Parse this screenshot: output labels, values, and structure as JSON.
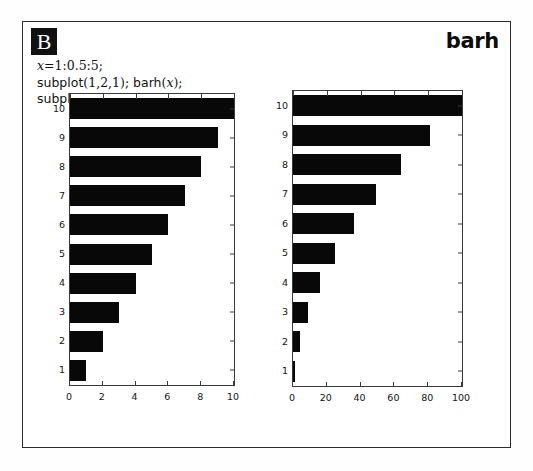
{
  "figure": {
    "panel_label": "B",
    "function_name": "barh",
    "frame_color": "#2b2b2b",
    "bar_color": "#080808",
    "badge_bg": "#111111",
    "badge_fg": "#ffffff"
  },
  "code": {
    "lines": [
      {
        "id": "line-1",
        "segments": [
          {
            "kind": "math-italic",
            "text": "x"
          },
          {
            "kind": "math",
            "text": "=1:0.5:5;"
          }
        ]
      },
      {
        "id": "line-2",
        "segments": [
          {
            "kind": "plain",
            "text": "subplot"
          },
          {
            "kind": "math",
            "text": "(1,2,1);"
          },
          {
            "kind": "plain",
            "text": " barh"
          },
          {
            "kind": "math",
            "text": "("
          },
          {
            "kind": "math-italic",
            "text": "x"
          },
          {
            "kind": "math",
            "text": ");"
          }
        ]
      },
      {
        "id": "line-3",
        "segments": [
          {
            "kind": "plain",
            "text": "subplot"
          },
          {
            "kind": "math",
            "text": "(1,2,2);"
          },
          {
            "kind": "plain",
            "text": " barh"
          },
          {
            "kind": "math",
            "text": "("
          },
          {
            "kind": "math-italic",
            "text": "x"
          },
          {
            "kind": "math",
            "text": ". ∧ 2)"
          }
        ]
      }
    ],
    "plain_text": [
      "x=1:0.5:5;",
      "subplot(1,2,1); barh(x);",
      "subplot(1,2,2); barh(x. ∧ 2)"
    ]
  },
  "chart_data": [
    {
      "id": "left",
      "type": "bar",
      "orientation": "horizontal",
      "title": "",
      "xlabel": "",
      "ylabel": "",
      "categories": [
        "1",
        "2",
        "3",
        "4",
        "5",
        "6",
        "7",
        "8",
        "9",
        "10"
      ],
      "values": [
        1,
        2,
        3,
        4,
        5,
        6,
        7,
        8,
        9,
        10
      ],
      "xlim": [
        0,
        10
      ],
      "ylim": [
        0.5,
        10.5
      ],
      "xticks": [
        0,
        2,
        4,
        6,
        8,
        10
      ],
      "xticklabels": [
        "0",
        "2",
        "4",
        "6",
        "8",
        "10"
      ],
      "yticks": [
        1,
        2,
        3,
        4,
        5,
        6,
        7,
        8,
        9,
        10
      ],
      "yticklabels": [
        "1",
        "2",
        "3",
        "4",
        "5",
        "6",
        "7",
        "8",
        "9",
        "10"
      ],
      "grid": false,
      "legend": null,
      "color": "#080808"
    },
    {
      "id": "right",
      "type": "bar",
      "orientation": "horizontal",
      "title": "",
      "xlabel": "",
      "ylabel": "",
      "categories": [
        "1",
        "2",
        "3",
        "4",
        "5",
        "6",
        "7",
        "8",
        "9",
        "10"
      ],
      "values": [
        1,
        4,
        9,
        16,
        25,
        36,
        49,
        64,
        81,
        100
      ],
      "xlim": [
        0,
        100
      ],
      "ylim": [
        0.5,
        10.5
      ],
      "xticks": [
        0,
        20,
        40,
        60,
        80,
        100
      ],
      "xticklabels": [
        "0",
        "20",
        "40",
        "60",
        "80",
        "100"
      ],
      "yticks": [
        1,
        2,
        3,
        4,
        5,
        6,
        7,
        8,
        9,
        10
      ],
      "yticklabels": [
        "1",
        "2",
        "3",
        "4",
        "5",
        "6",
        "7",
        "8",
        "9",
        "10"
      ],
      "grid": false,
      "legend": null,
      "color": "#080808"
    }
  ]
}
